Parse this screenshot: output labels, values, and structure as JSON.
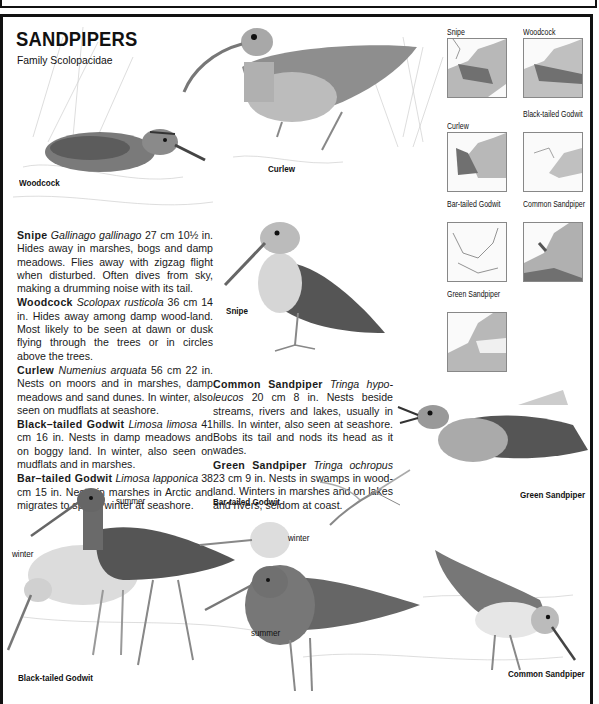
{
  "header": {
    "title": "SANDPIPERS",
    "subtitle": "Family Scolopacidae"
  },
  "species": [
    {
      "name": "Snipe",
      "latin": "Gallinago gallinago",
      "size": "27 cm 10½ in.",
      "text": "Hides away in marshes, bogs and damp meadows. Flies away with zigzag flight when disturbed. Often dives from sky, making a drumming noise with its tail."
    },
    {
      "name": "Woodcock",
      "latin": "Scolopax rusticola",
      "size": "36 cm 14 in.",
      "text": "Hides away among damp wood-land. Most likely to be seen at dawn or dusk flying through the trees or in circles above the trees."
    },
    {
      "name": "Curlew",
      "latin": "Numenius arquata",
      "size": "56 cm 22 in.",
      "text": "Nests on moors and in marshes, damp meadows and sand dunes. In winter, also seen on mudflats at seashore."
    },
    {
      "name": "Black–tailed Godwit",
      "latin": "Limosa limosa",
      "size": "41 cm 16 in.",
      "text": "Nests in damp meadows and on boggy land. In winter, also seen on mudflats and in marshes."
    },
    {
      "name": "Bar–tailed Godwit",
      "latin": "Limosa lapponica",
      "size": "38 cm 15 in.",
      "text": "Nests in marshes in Arctic and migrates to spend winter at seashore."
    },
    {
      "name": "Common Sandpiper",
      "latin": "Tringa hypo-leucos",
      "size": "20 cm 8 in.",
      "text": "Nests beside streams, rivers and lakes, usually in hills. In winter, also seen at seashore. Bobs its tail and nods its head as it wades."
    },
    {
      "name": "Green Sandpiper",
      "latin": "Tringa ochropus",
      "size": "23 cm 9 in.",
      "text": "Nests in swamps in wood-land. Winters in marshes and on lakes and rivers, seldom at coast."
    }
  ],
  "illustration_labels": {
    "woodcock": "Woodcock",
    "curlew": "Curlew",
    "snipe": "Snipe",
    "black_tailed_godwit": "Black-tailed Godwit",
    "bar_tailed_godwit": "Bar-tailed Godwit",
    "green_sandpiper": "Green Sandpiper",
    "common_sandpiper": "Common Sandpiper",
    "summer_1": "summer",
    "winter_1": "winter",
    "winter_2": "winter",
    "summer_2": "summer"
  },
  "maps": [
    {
      "title": "Snipe"
    },
    {
      "title": "Woodcock"
    },
    {
      "title": "Curlew"
    },
    {
      "title": "Black-tailed Godwit"
    },
    {
      "title": "Bar-tailed Godwit"
    },
    {
      "title": "Common Sandpiper"
    },
    {
      "title": "Green Sandpiper"
    }
  ],
  "colors": {
    "border": "#111111",
    "bird_dark": "#4a4a4a",
    "bird_mid": "#8a8a8a",
    "bird_light": "#cfcfcf",
    "range_dark": "#707070",
    "range_light": "#b8b8b8"
  }
}
